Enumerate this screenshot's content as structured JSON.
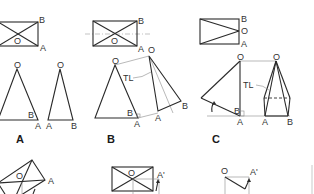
{
  "figure": {
    "type": "descriptive-geometry true-length diagram",
    "panels": [
      {
        "id": "A",
        "caption": "A",
        "plan_labels": {
          "b": "B",
          "o": "O",
          "a": "A"
        },
        "elev1_labels": {
          "o": "O",
          "b": "B",
          "a": "A"
        },
        "elev2_labels": {
          "o": "O",
          "a": "A",
          "b": "B"
        }
      },
      {
        "id": "B",
        "caption": "B",
        "plan_labels": {
          "b": "B",
          "o": "O",
          "a": "A"
        },
        "elev_labels": {
          "o": "O",
          "b": "B",
          "a": "A"
        },
        "aux_labels": {
          "o": "O",
          "a": "A",
          "b": "B",
          "tl": "TL"
        }
      },
      {
        "id": "C",
        "caption": "C",
        "plan_labels": {
          "b": "B",
          "o": "O",
          "a": "A"
        },
        "elev_labels": {
          "o": "O",
          "b": "B",
          "a": "A"
        },
        "pyr_labels": {
          "o": "O",
          "a": "A",
          "b": "B",
          "tl": "TL"
        }
      }
    ],
    "lower_row": [
      {
        "id": "A2",
        "labels": {
          "o": "O",
          "a": "A"
        }
      },
      {
        "id": "B2",
        "labels": {
          "o": "O",
          "a": "A'"
        }
      },
      {
        "id": "C2",
        "labels": {
          "o": "O",
          "a": "A'"
        }
      }
    ]
  }
}
